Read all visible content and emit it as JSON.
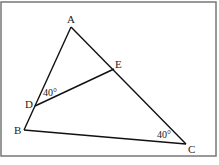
{
  "diagram": {
    "type": "geometry-triangle",
    "points": {
      "A": {
        "label": "A",
        "x": 71,
        "y": 27
      },
      "B": {
        "label": "B",
        "x": 24,
        "y": 130
      },
      "C": {
        "label": "C",
        "x": 186,
        "y": 144
      },
      "D": {
        "label": "D",
        "x": 35,
        "y": 106
      },
      "E": {
        "label": "E",
        "x": 114,
        "y": 69
      }
    },
    "segments": [
      "AB",
      "AC",
      "BC",
      "DE"
    ],
    "angles": [
      {
        "at": "D",
        "label": "40°"
      },
      {
        "at": "C",
        "label": "40°"
      }
    ]
  }
}
